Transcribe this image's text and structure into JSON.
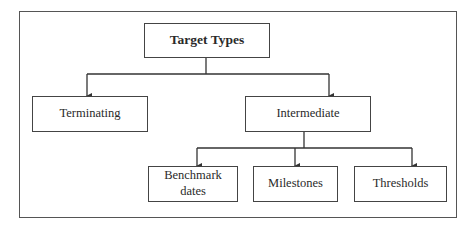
{
  "diagram": {
    "type": "tree",
    "root": {
      "id": "target-types",
      "label": "Target Types"
    },
    "nodes": [
      {
        "id": "terminating",
        "label": "Terminating",
        "parent": "target-types"
      },
      {
        "id": "intermediate",
        "label": "Intermediate",
        "parent": "target-types"
      },
      {
        "id": "benchmark-dates",
        "label": "Benchmark dates",
        "line1": "Benchmark",
        "line2": "dates",
        "parent": "intermediate"
      },
      {
        "id": "milestones",
        "label": "Milestones",
        "parent": "intermediate"
      },
      {
        "id": "thresholds",
        "label": "Thresholds",
        "parent": "intermediate"
      }
    ],
    "colors": {
      "stroke": "#444444",
      "background": "#ffffff",
      "text": "#2a2a2a"
    }
  }
}
